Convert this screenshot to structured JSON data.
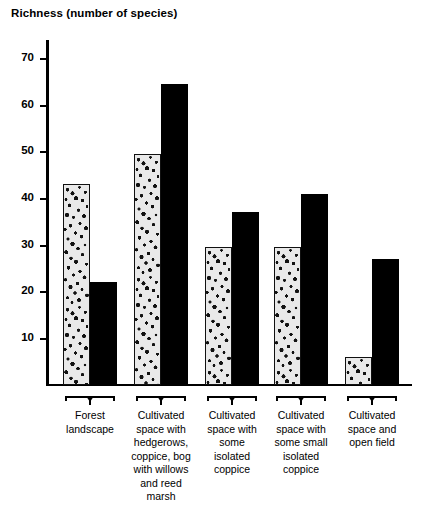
{
  "chart_data": {
    "type": "bar",
    "title": "Richness (number of species)",
    "xlabel": "",
    "ylabel": "Richness (number of species)",
    "ylim": [
      0,
      75
    ],
    "yticks": [
      10,
      20,
      30,
      40,
      50,
      60,
      70
    ],
    "grid": false,
    "legend": null,
    "categories": [
      "Forest landscape",
      "Cultivated space with hedgerows, coppice, bog with willows and reed marsh",
      "Cultivated space with some isolated coppice",
      "Cultivated space with some small isolated coppice",
      "Cultivated space and open field"
    ],
    "category_lines": [
      [
        "Forest",
        "landscape"
      ],
      [
        "Cultivated",
        "space with",
        "hedgerows,",
        "coppice, bog",
        "with willows",
        "and reed",
        "marsh"
      ],
      [
        "Cultivated",
        "space with",
        "some",
        "isolated",
        "coppice"
      ],
      [
        "Cultivated",
        "space with",
        "some small",
        "isolated",
        "coppice"
      ],
      [
        "Cultivated",
        "space and",
        "open field"
      ]
    ],
    "series": [
      {
        "name": "speckled",
        "fill": "speckled",
        "values": [
          43,
          49.5,
          29.5,
          29.5,
          6
        ]
      },
      {
        "name": "black",
        "fill": "solid-black",
        "values": [
          22,
          64.5,
          37,
          41,
          27
        ]
      }
    ],
    "colors": {
      "black": "#000000",
      "speckled_fill": "#e9e9e9",
      "speckled_dots": "#121212",
      "axis": "#000000"
    }
  },
  "axis": {
    "tick_labels": [
      "70",
      "60",
      "50",
      "40",
      "30",
      "20",
      "10"
    ]
  }
}
